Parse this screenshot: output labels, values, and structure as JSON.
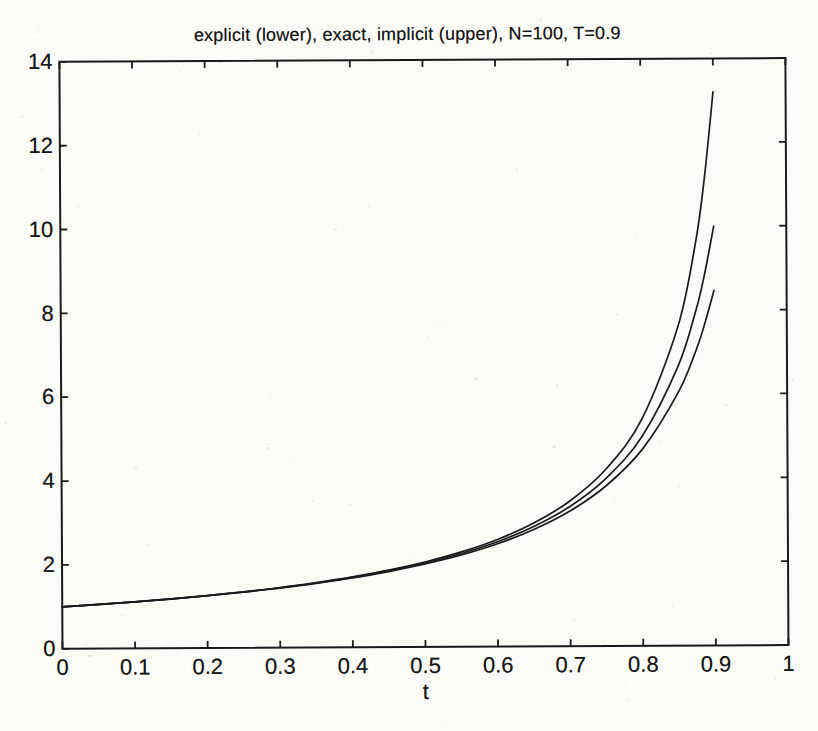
{
  "colors": {
    "ink": "#1b1b1b",
    "paper": "#fbfbf8",
    "speckle": "#9a9a92"
  },
  "chart_data": {
    "type": "line",
    "title": "explicit (lower), exact, implicit (upper), N=100, T=0.9",
    "xlabel": "t",
    "ylabel": "",
    "params": {
      "N": 100,
      "T": 0.9
    },
    "xlim": [
      0,
      1
    ],
    "ylim": [
      0,
      14
    ],
    "grid": false,
    "legend": false,
    "box": true,
    "ticks_inward_mirrored": true,
    "xticks": [
      0,
      0.1,
      0.2,
      0.3,
      0.4,
      0.5,
      0.6,
      0.7,
      0.8,
      0.9,
      1
    ],
    "xtick_labels": [
      "0",
      "0.1",
      "0.2",
      "0.3",
      "0.4",
      "0.5",
      "0.6",
      "0.7",
      "0.8",
      "0.9",
      "1"
    ],
    "yticks": [
      0,
      2,
      4,
      6,
      8,
      10,
      12,
      14
    ],
    "ytick_labels": [
      "0",
      "2",
      "4",
      "6",
      "8",
      "10",
      "12",
      "14"
    ],
    "x": [
      0,
      0.05,
      0.1,
      0.15,
      0.2,
      0.25,
      0.3,
      0.35,
      0.4,
      0.45,
      0.5,
      0.55,
      0.6,
      0.65,
      0.7,
      0.75,
      0.8,
      0.85,
      0.875,
      0.8875,
      0.9
    ],
    "series": [
      {
        "name": "explicit Euler (lower curve)",
        "values": [
          1.0,
          1.052,
          1.11,
          1.174,
          1.247,
          1.329,
          1.422,
          1.53,
          1.654,
          1.801,
          1.976,
          2.188,
          2.451,
          2.785,
          3.222,
          3.82,
          4.684,
          6.039,
          7.05,
          7.7,
          8.47
        ]
      },
      {
        "name": "exact solution y = 1/(1-t) (middle curve)",
        "values": [
          1.0,
          1.053,
          1.111,
          1.176,
          1.25,
          1.333,
          1.429,
          1.538,
          1.667,
          1.818,
          2.0,
          2.222,
          2.5,
          2.857,
          3.333,
          4.0,
          5.0,
          6.667,
          8.0,
          8.89,
          10.0
        ]
      },
      {
        "name": "implicit Euler (upper curve)",
        "values": [
          1.0,
          1.053,
          1.112,
          1.179,
          1.253,
          1.338,
          1.435,
          1.548,
          1.68,
          1.837,
          2.026,
          2.26,
          2.555,
          2.94,
          3.464,
          4.222,
          5.419,
          7.608,
          9.63,
          11.15,
          13.2
        ]
      }
    ]
  }
}
